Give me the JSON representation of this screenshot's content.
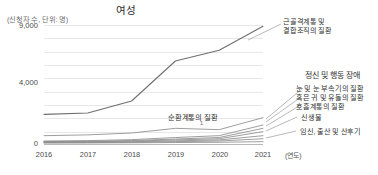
{
  "chart_data": {
    "type": "line",
    "title": "여성",
    "ylabel": "(신청자 수, 단위: 명)",
    "xlabel": "(연도)",
    "x": [
      "2016",
      "2017",
      "2018",
      "2019",
      "2020",
      "2021"
    ],
    "yticks": [
      "0",
      "4,000",
      "9,000"
    ],
    "ytick_values": [
      0,
      4000,
      9000
    ],
    "ylim": [
      0,
      9000
    ],
    "grid": true,
    "legend": "right-side leader-line callouts",
    "series": [
      {
        "name": "근골격계통 및 결합조직의 질환",
        "values": [
          2300,
          2400,
          3300,
          6300,
          7100,
          8900
        ]
      },
      {
        "name": "정신 및 행동 장애",
        "values": [
          700,
          760,
          900,
          1250,
          1150,
          2050
        ]
      },
      {
        "name": "눈 및 눈 부속기의 질환",
        "values": [
          300,
          330,
          400,
          560,
          700,
          1500
        ]
      },
      {
        "name": "혹은 귀 및 유돌의 질환",
        "values": [
          260,
          280,
          330,
          450,
          560,
          1250
        ]
      },
      {
        "name": "호흡계통의 질환",
        "values": [
          230,
          250,
          290,
          380,
          470,
          1000
        ]
      },
      {
        "name": "순환계통의 질환",
        "values": [
          200,
          215,
          245,
          310,
          380,
          700
        ]
      },
      {
        "name": "신생물",
        "values": [
          170,
          180,
          200,
          250,
          300,
          470
        ]
      },
      {
        "name": "임신, 출산 및 산후기",
        "values": [
          150,
          155,
          165,
          185,
          205,
          250
        ]
      }
    ],
    "callouts": [
      {
        "label_line1": "근골격계통 및",
        "label_line2": "결합조직의 질환"
      },
      {
        "label_line1": "정신 및 행동 장애"
      },
      {
        "label_line1": "눈 및 눈 부속기의 질환"
      },
      {
        "label_line1": "혹은 귀 및 유돌의 질환"
      },
      {
        "label_line1": "호흡계통의 질환"
      },
      {
        "label_line1": "신생물"
      },
      {
        "label_line1": "임신, 출산 및 산후기"
      }
    ],
    "inline_label": "순환계통의 질환",
    "inline_marker": "1",
    "colors": {
      "line": "#8d8d8d",
      "line_dark": "#6f6f6f",
      "grid": "#e8e8e8",
      "axis": "#b9b9b9",
      "text": "#2f2f2f"
    }
  }
}
